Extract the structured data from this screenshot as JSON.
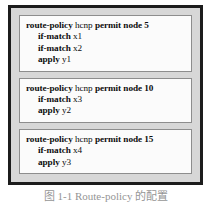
{
  "figure": {
    "caption": "图 1-1  Route-policy 的配置",
    "blocks": [
      {
        "header": {
          "command": "route-policy",
          "name": "hcnp",
          "action": "permit node 5"
        },
        "lines": [
          {
            "keyword": "if-match",
            "value": "x1"
          },
          {
            "keyword": "if-match",
            "value": "x2"
          },
          {
            "keyword": "apply",
            "value": "y1"
          }
        ]
      },
      {
        "header": {
          "command": "route-policy",
          "name": "hcnp",
          "action": "permit node 10"
        },
        "lines": [
          {
            "keyword": "if-match",
            "value": "x3"
          },
          {
            "keyword": "apply",
            "value": "y2"
          }
        ]
      },
      {
        "header": {
          "command": "route-policy",
          "name": "hcnp",
          "action": "permit node 15"
        },
        "lines": [
          {
            "keyword": "if-match",
            "value": "x4"
          },
          {
            "keyword": "apply",
            "value": "y3"
          }
        ]
      }
    ]
  },
  "colors": {
    "frame_border": "#1c1c1c",
    "frame_fill": "#d7d7d7",
    "block_fill": "#fbfbfb",
    "block_border": "#8d8d8d",
    "text": "#0d0d0d"
  }
}
